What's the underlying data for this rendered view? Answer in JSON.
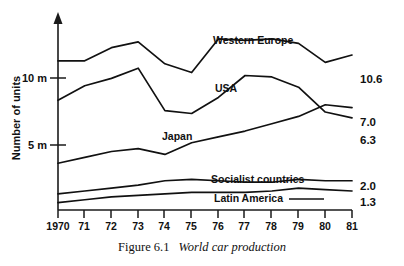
{
  "figure": {
    "caption_number": "Figure 6.1",
    "caption_title": "World car production"
  },
  "chart_data": {
    "type": "line",
    "title": "World car production",
    "xlabel": "",
    "ylabel": "Number of units",
    "x": [
      1970,
      1971,
      1972,
      1973,
      1974,
      1975,
      1976,
      1977,
      1978,
      1979,
      1980,
      1981
    ],
    "xtick_labels": [
      "1970",
      "71",
      "72",
      "73",
      "74",
      "75",
      "76",
      "77",
      "78",
      "79",
      "80",
      "81"
    ],
    "ytick_labels": [
      "10 m",
      "5 m"
    ],
    "ytick_values": [
      10,
      5
    ],
    "xlim": [
      1970,
      1981
    ],
    "ylim": [
      0,
      13.2
    ],
    "grid": false,
    "legend": "inline-labels",
    "series": [
      {
        "name": "Western Europe",
        "label": "Western Europe",
        "end_value": "10.6",
        "values": [
          10.2,
          10.2,
          11.1,
          11.5,
          10.0,
          9.4,
          11.7,
          11.6,
          11.7,
          11.4,
          10.1,
          10.6
        ]
      },
      {
        "name": "USA",
        "label": "USA",
        "end_value": "6.3",
        "values": [
          7.5,
          8.5,
          9.0,
          9.7,
          6.8,
          6.6,
          7.7,
          9.2,
          9.1,
          8.4,
          6.7,
          6.3
        ]
      },
      {
        "name": "Japan",
        "label": "Japan",
        "end_value": "7.0",
        "values": [
          3.2,
          3.6,
          4.0,
          4.2,
          3.8,
          4.6,
          5.0,
          5.4,
          5.9,
          6.4,
          7.2,
          7.0
        ]
      },
      {
        "name": "Socialist countries",
        "label": "Socialist countries",
        "end_value": "2.0",
        "values": [
          1.1,
          1.3,
          1.5,
          1.7,
          2.0,
          2.1,
          2.0,
          1.9,
          1.9,
          2.1,
          2.0,
          2.0
        ]
      },
      {
        "name": "Latin America",
        "label": "Latin America",
        "end_value": "1.3",
        "values": [
          0.5,
          0.7,
          0.9,
          1.0,
          1.1,
          1.2,
          1.2,
          1.2,
          1.3,
          1.5,
          1.4,
          1.3
        ]
      }
    ]
  }
}
